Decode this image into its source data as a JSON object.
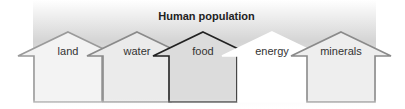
{
  "diagram": {
    "title": "Human population",
    "arrows": [
      {
        "label": "land",
        "cx": 68,
        "fill": "#f3f3f3",
        "stroke": "#9a9a9a"
      },
      {
        "label": "water",
        "cx": 137,
        "fill": "#ebebeb",
        "stroke": "#8a8a8a"
      },
      {
        "label": "food",
        "cx": 203,
        "fill": "#dcdcdc",
        "stroke": "#222222"
      },
      {
        "label": "energy",
        "cx": 272,
        "fill": "#ffffff",
        "stroke": "#ffffff"
      },
      {
        "label": "minerals",
        "cx": 341,
        "fill": "#eeeeee",
        "stroke": "#8a8a8a"
      }
    ]
  }
}
